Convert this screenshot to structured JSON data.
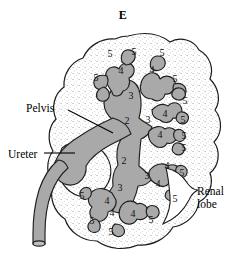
{
  "figure": {
    "panel_label": "E",
    "colors": {
      "outline": "#1a1a1a",
      "cortex_fill": "#ffffff",
      "cortex_stipple": "#8d8d8d",
      "pelvis_fill": "#a9a9a9",
      "pelvis_outline": "#1f1f1f",
      "leader_line": "#000000"
    }
  },
  "callouts": [
    {
      "id": "pelvis",
      "label": "Pelvis",
      "leader": "diagonal"
    },
    {
      "id": "ureter",
      "label": "Ureter",
      "leader": "horizontal"
    },
    {
      "id": "renal_lobe",
      "label": "Renal\nlobe",
      "leader": "bracket"
    }
  ],
  "numbered_structures": [
    {
      "value": "2",
      "x": 127,
      "y": 121
    },
    {
      "value": "2",
      "x": 124,
      "y": 161
    },
    {
      "value": "3",
      "x": 131,
      "y": 96
    },
    {
      "value": "3",
      "x": 148,
      "y": 120
    },
    {
      "value": "3",
      "x": 147,
      "y": 176
    },
    {
      "value": "3",
      "x": 120,
      "y": 188
    },
    {
      "value": "4",
      "x": 121,
      "y": 71
    },
    {
      "value": "4",
      "x": 152,
      "y": 70
    },
    {
      "value": "4",
      "x": 165,
      "y": 114
    },
    {
      "value": "4",
      "x": 160,
      "y": 135
    },
    {
      "value": "4",
      "x": 167,
      "y": 166
    },
    {
      "value": "4",
      "x": 158,
      "y": 184
    },
    {
      "value": "4",
      "x": 107,
      "y": 201
    },
    {
      "value": "4",
      "x": 112,
      "y": 213
    },
    {
      "value": "4",
      "x": 133,
      "y": 214
    },
    {
      "value": "5",
      "x": 110,
      "y": 54
    },
    {
      "value": "5",
      "x": 134,
      "y": 52
    },
    {
      "value": "5",
      "x": 162,
      "y": 53
    },
    {
      "value": "5",
      "x": 96,
      "y": 78
    },
    {
      "value": "5",
      "x": 175,
      "y": 79
    },
    {
      "value": "5",
      "x": 185,
      "y": 101
    },
    {
      "value": "5",
      "x": 183,
      "y": 120
    },
    {
      "value": "5",
      "x": 184,
      "y": 136
    },
    {
      "value": "5",
      "x": 184,
      "y": 148
    },
    {
      "value": "5",
      "x": 182,
      "y": 173
    },
    {
      "value": "5",
      "x": 175,
      "y": 199
    },
    {
      "value": "5",
      "x": 82,
      "y": 196
    },
    {
      "value": "5",
      "x": 92,
      "y": 221
    },
    {
      "value": "5",
      "x": 111,
      "y": 232
    },
    {
      "value": "5",
      "x": 151,
      "y": 220
    }
  ]
}
